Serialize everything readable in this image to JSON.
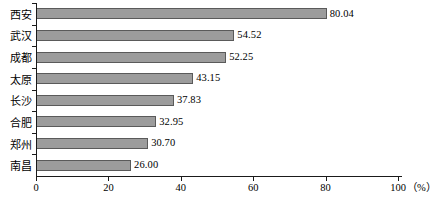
{
  "chart_data": {
    "type": "bar",
    "orientation": "horizontal",
    "title": "",
    "xlabel": "(%)",
    "ylabel": "",
    "categories": [
      "西安",
      "武汉",
      "成都",
      "太原",
      "长沙",
      "合肥",
      "郑州",
      "南昌"
    ],
    "values": [
      80.04,
      54.52,
      52.25,
      43.15,
      37.83,
      32.95,
      30.7,
      26.0
    ],
    "value_labels": [
      "80.04",
      "54.52",
      "52.25",
      "43.15",
      "37.83",
      "32.95",
      "30.70",
      "26.00"
    ],
    "xlim": [
      0,
      100
    ],
    "xticks": [
      0,
      20,
      40,
      60,
      80,
      100
    ],
    "xtick_labels": [
      "0",
      "20",
      "40",
      "60",
      "80",
      "100"
    ],
    "unit_label": "（%）",
    "grid": false,
    "legend": null,
    "bar_fill_color": "#9c9c9c",
    "bar_edge_color": "#5a5a5a",
    "axis_color": "#1a1a1a",
    "background_color": "#ffffff"
  }
}
